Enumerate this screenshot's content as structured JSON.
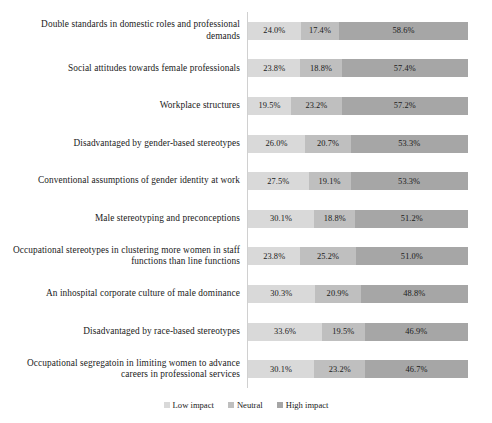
{
  "chart_data": {
    "type": "bar",
    "orientation": "horizontal",
    "stacked": true,
    "stack_total": 100,
    "title": "",
    "xlabel": "",
    "ylabel": "",
    "xlim": [
      0,
      100
    ],
    "grid": false,
    "legend_position": "bottom-center",
    "value_suffix": "%",
    "categories": [
      "Double standards in domestic roles and professional demands",
      "Social attitudes towards female professionals",
      "Workplace structures",
      "Disadvantaged by gender-based stereotypes",
      "Conventional assumptions of gender identity at work",
      "Male stereotyping and preconceptions",
      "Occupational stereotypes in clustering more women in staff functions than line functions",
      "An inhospital corporate culture of male dominance",
      "Disadvantaged by race-based stereotypes",
      "Occupational segregatoin in limiting women to advance careers in professional services"
    ],
    "series": [
      {
        "name": "Low impact",
        "color": "#d9d9d9",
        "values": [
          24.0,
          23.8,
          19.5,
          26.0,
          27.5,
          30.1,
          23.8,
          30.3,
          33.6,
          30.1
        ],
        "labels": [
          "24.0%",
          "23.8%",
          "19.5%",
          "26.0%",
          "27.5%",
          "30.1%",
          "23.8%",
          "30.3%",
          "33.6%",
          "30.1%"
        ]
      },
      {
        "name": "Neutral",
        "color": "#bfbfbf",
        "values": [
          17.4,
          18.8,
          23.2,
          20.7,
          19.1,
          18.8,
          25.2,
          20.9,
          19.5,
          23.2
        ],
        "labels": [
          "17.4%",
          "18.8%",
          "23.2%",
          "20.7%",
          "19.1%",
          "18.8%",
          "25.2%",
          "20.9%",
          "19.5%",
          "23.2%"
        ]
      },
      {
        "name": "High impact",
        "color": "#a6a6a6",
        "values": [
          58.6,
          57.4,
          57.2,
          53.3,
          53.3,
          51.2,
          51.0,
          48.8,
          46.9,
          46.7
        ],
        "labels": [
          "58.6%",
          "57.4%",
          "57.2%",
          "53.3%",
          "53.3%",
          "51.2%",
          "51.0%",
          "48.8%",
          "46.9%",
          "46.7%"
        ]
      }
    ]
  },
  "legend": {
    "items": [
      {
        "label": "Low impact",
        "color": "#d9d9d9",
        "marker": "square-swatch-icon"
      },
      {
        "label": "Neutral",
        "color": "#bfbfbf",
        "marker": "square-swatch-icon"
      },
      {
        "label": "High impact",
        "color": "#a6a6a6",
        "marker": "square-swatch-icon"
      }
    ]
  }
}
